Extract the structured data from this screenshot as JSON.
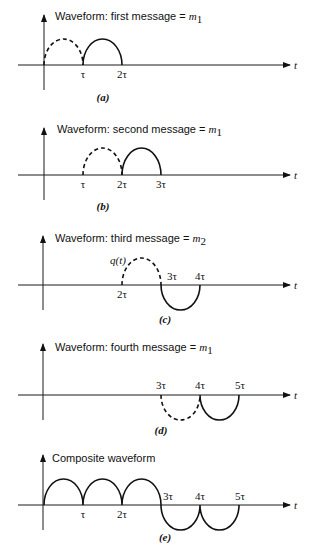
{
  "axis_label": "t",
  "panels": [
    {
      "id": "a",
      "title": "Waveform: first message = ",
      "title_symbol": "m",
      "title_sub": "1",
      "caption": "(a)",
      "ticks": [
        "τ",
        "2τ"
      ]
    },
    {
      "id": "b",
      "title": "Waveform: second message = ",
      "title_symbol": "m",
      "title_sub": "1",
      "caption": "(b)",
      "ticks": [
        "τ",
        "2τ",
        "3τ"
      ]
    },
    {
      "id": "c",
      "title": "Waveform: third message = ",
      "title_symbol": "m",
      "title_sub": "2",
      "caption": "(c)",
      "ticks": [
        "2τ",
        "3τ",
        "4τ"
      ],
      "annotation": "q(t)"
    },
    {
      "id": "d",
      "title": "Waveform: fourth message = ",
      "title_symbol": "m",
      "title_sub": "1",
      "caption": "(d)",
      "ticks": [
        "3τ",
        "4τ",
        "5τ"
      ]
    },
    {
      "id": "e",
      "title": "Composite waveform",
      "caption": "(e)",
      "ticks": [
        "τ",
        "2τ",
        "3τ",
        "4τ",
        "5τ"
      ]
    }
  ]
}
